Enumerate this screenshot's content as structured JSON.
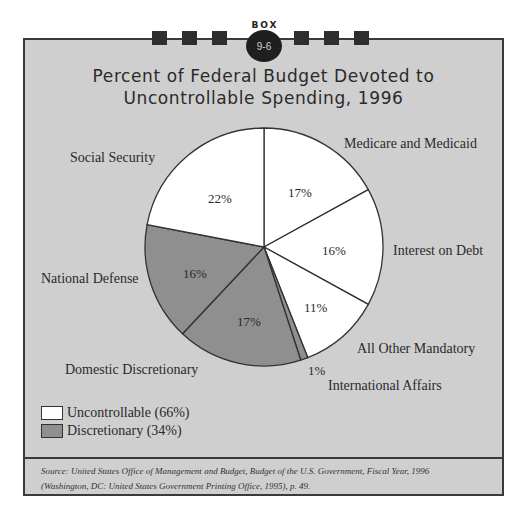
{
  "header": {
    "box_word": "BOX",
    "box_number": "9-6",
    "title_line1": "Percent of Federal Budget Devoted to",
    "title_line2": "Uncontrollable Spending, 1996"
  },
  "colors": {
    "background": "#cfcfcf",
    "uncontrollable": "#ffffff",
    "discretionary": "#8f8f8f",
    "border": "#3a3a3a"
  },
  "labels": {
    "medicare": "Medicare and Medicaid",
    "interest": "Interest on Debt",
    "all_other": "All Other Mandatory",
    "international": "International Affairs",
    "domestic": "Domestic Discretionary",
    "defense": "National Defense",
    "social_security": "Social Security"
  },
  "percents": {
    "medicare": "17%",
    "interest": "16%",
    "all_other": "11%",
    "international": "1%",
    "domestic": "17%",
    "defense": "16%",
    "social_security": "22%"
  },
  "legend": {
    "uncontrollable": "Uncontrollable (66%)",
    "discretionary": "Discretionary (34%)"
  },
  "source": {
    "line1": "Source: United States Office of Management and Budget, Budget of the U.S. Government, Fiscal Year, 1996",
    "line2": "(Washington, DC: United States Government Printing Office, 1995), p. 49."
  },
  "chart_data": {
    "type": "pie",
    "categories": [
      "Medicare and Medicaid",
      "Interest on Debt",
      "All Other Mandatory",
      "International Affairs",
      "Domestic Discretionary",
      "National Defense",
      "Social Security"
    ],
    "values": [
      17,
      16,
      11,
      1,
      17,
      16,
      22
    ],
    "groups": [
      "Uncontrollable",
      "Uncontrollable",
      "Uncontrollable",
      "Discretionary",
      "Discretionary",
      "Discretionary",
      "Uncontrollable"
    ],
    "legend": [
      {
        "name": "Uncontrollable",
        "value": 66,
        "color": "#ffffff"
      },
      {
        "name": "Discretionary",
        "value": 34,
        "color": "#8f8f8f"
      }
    ],
    "start_angle": "12 o'clock, clockwise",
    "legend_position": "bottom-left"
  }
}
